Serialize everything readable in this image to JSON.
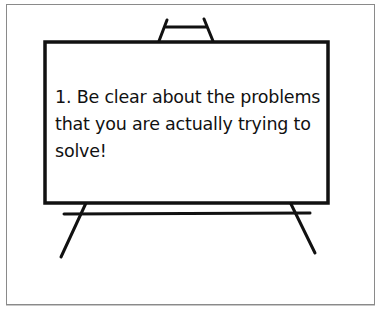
{
  "slide": {
    "lines": [
      "1.  Be clear about the problems",
      "that you are actually trying to",
      "solve!"
    ]
  },
  "colors": {
    "ink": "#111111",
    "frame": "#8a8a8a",
    "background": "#ffffff"
  }
}
